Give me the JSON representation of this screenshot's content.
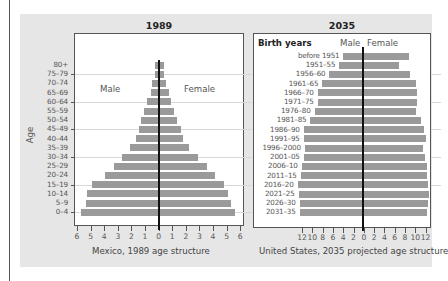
{
  "colors": {
    "bar": "#9a9a9a",
    "panel": "#e6e6e6",
    "center_line": "#111111",
    "frame": "#555555"
  },
  "chart_data": [
    {
      "type": "bar",
      "orientation": "horizontal",
      "subtype": "population-pyramid",
      "title": "1989",
      "caption": "Mexico, 1989 age structure",
      "ylabel": "Age",
      "xlabel": "",
      "xlim": [
        -6,
        6
      ],
      "x_tick_labels": [
        "6",
        "5",
        "4",
        "3",
        "2",
        "1",
        "0",
        "1",
        "2",
        "3",
        "4",
        "5",
        "6"
      ],
      "annotations": [
        "Male",
        "Female"
      ],
      "categories": [
        "80+",
        "75–79",
        "70–74",
        "65–69",
        "60–64",
        "55–59",
        "50–54",
        "45–49",
        "40–44",
        "35–39",
        "30–34",
        "25–29",
        "20–24",
        "15–19",
        "10–14",
        "5–9",
        "0–4"
      ],
      "series": [
        {
          "name": "Male",
          "values": [
            0.3,
            0.3,
            0.5,
            0.6,
            0.9,
            1.1,
            1.3,
            1.5,
            1.7,
            2.1,
            2.7,
            3.3,
            4.0,
            4.9,
            5.3,
            5.4,
            5.7
          ]
        },
        {
          "name": "Female",
          "values": [
            0.4,
            0.4,
            0.5,
            0.7,
            0.9,
            1.1,
            1.3,
            1.6,
            1.8,
            2.2,
            2.9,
            3.5,
            4.1,
            4.8,
            5.1,
            5.3,
            5.6
          ]
        }
      ],
      "grid": "horizontal every 15 years"
    },
    {
      "type": "bar",
      "orientation": "horizontal",
      "subtype": "population-pyramid",
      "title": "2035",
      "caption": "United States, 2035 projected age structure",
      "ylabel": "Birth years",
      "xlabel": "",
      "xlim": [
        -12,
        12
      ],
      "x_tick_labels": [
        "12",
        "10",
        "8",
        "6",
        "4",
        "2",
        "0",
        "2",
        "4",
        "6",
        "8",
        "10",
        "12"
      ],
      "annotations": [
        "Male",
        "Female"
      ],
      "categories": [
        "before 1951",
        "1951–55",
        "1956–60",
        "1961–65",
        "1966–70",
        "1971–75",
        "1976–80",
        "1981–85",
        "1986–90",
        "1991–95",
        "1996–2000",
        "2001–05",
        "2006–10",
        "2011–15",
        "2016–20",
        "2021–25",
        "2026–30",
        "2031–35"
      ],
      "series": [
        {
          "name": "Male",
          "values": [
            4.0,
            4.8,
            6.7,
            8.1,
            9.0,
            9.0,
            9.6,
            10.4,
            11.7,
            11.7,
            11.5,
            11.7,
            12.1,
            12.3,
            12.9,
            12.7,
            12.5,
            12.5
          ]
        },
        {
          "name": "Female",
          "values": [
            8.8,
            6.7,
            9.0,
            10.0,
            10.2,
            10.2,
            10.0,
            11.0,
            11.7,
            12.0,
            11.5,
            11.9,
            12.3,
            12.3,
            12.5,
            12.7,
            12.5,
            12.3
          ]
        }
      ]
    }
  ],
  "left": {
    "title": "1989",
    "caption": "Mexico, 1989 age structure",
    "male_label": "Male",
    "female_label": "Female",
    "axis_label": "Age"
  },
  "right": {
    "title": "2035",
    "caption": "United States, 2035 projected age structure",
    "header_label": "Birth years",
    "male_label": "Male",
    "female_label": "Female"
  }
}
